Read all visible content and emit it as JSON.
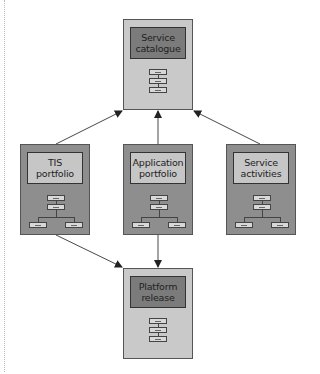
{
  "diagram": {
    "nodes": {
      "service_catalogue": {
        "label": "Service catalogue",
        "icon": "stack-chart-icon"
      },
      "tis_portfolio": {
        "label": "TIS portfolio",
        "icon": "org-chart-icon"
      },
      "application_portfolio": {
        "label": "Application portfolio",
        "icon": "org-chart-icon"
      },
      "service_activities": {
        "label": "Service activities",
        "icon": "org-chart-icon"
      },
      "platform_release": {
        "label": "Platform release",
        "icon": "stack-chart-icon"
      }
    },
    "edges": [
      {
        "from": "TIS portfolio",
        "to": "Service catalogue"
      },
      {
        "from": "Application portfolio",
        "to": "Service catalogue"
      },
      {
        "from": "Service activities",
        "to": "Service catalogue"
      },
      {
        "from": "TIS portfolio",
        "to": "Platform release"
      },
      {
        "from": "Application portfolio",
        "to": "Platform release"
      }
    ],
    "colors": {
      "light_node": "#c9c9c9",
      "dark_node": "#8e8e8e",
      "dark_title": "#7b7b7b",
      "light_title": "#c6c6c6"
    }
  }
}
